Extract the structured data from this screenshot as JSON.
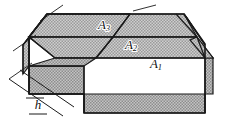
{
  "figure": {
    "background_color": "#ffffff",
    "outline_color": "#1a1a1a",
    "fill_color": "#b5b5b5",
    "fill_pattern": "stipple-halftone",
    "width": 230,
    "height": 121
  },
  "labels": {
    "area_1": {
      "base": "A",
      "sub": "1",
      "x": 156,
      "y": 65
    },
    "area_2": {
      "base": "A",
      "sub": "2",
      "x": 131,
      "y": 46
    },
    "area_3": {
      "base": "A",
      "sub": "3",
      "x": 104,
      "y": 26
    },
    "height": {
      "base": "h",
      "x": 38,
      "y": 106
    }
  },
  "faces": {
    "top_ridge_face": {
      "name": "A3",
      "description": "upper roof plane nearest the ridge",
      "points": "47,14 130,14 113,37 29,37"
    },
    "middle_face": {
      "name": "A2",
      "description": "intermediate roof plane",
      "points": "130,14 113,37 197,37 184,14"
    },
    "lower_face": {
      "name": "A1",
      "description": "largest lower roof plane",
      "points": "113,37 197,37 205,58 96,58"
    },
    "left_gable": {
      "description": "left end gable face",
      "points": "23,45 47,14 29,37 29,66"
    },
    "front_left_wall": {
      "description": "front lower-left vertical wall",
      "points": "29,66 84,66 84,94 29,94"
    },
    "front_main_wall": {
      "description": "front main vertical wall",
      "points": "84,94 205,94 205,113 84,113"
    },
    "right_bevel": {
      "description": "beveled right corner",
      "points": "197,37 213,58 205,58"
    }
  },
  "dimension": {
    "h_leader_lines": 2,
    "h_label": "h",
    "description": "height dimension between two parallel oblique leader lines on lower left"
  }
}
